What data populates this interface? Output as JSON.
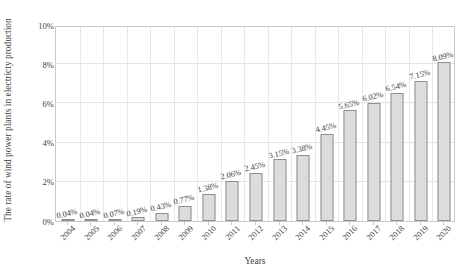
{
  "chart_data": {
    "type": "bar",
    "title": "",
    "xlabel": "Years",
    "ylabel": "The rate of wind power plants in electricty production",
    "categories": [
      "2004",
      "2005",
      "2006",
      "2007",
      "2008",
      "2009",
      "2010",
      "2011",
      "2012",
      "2013",
      "2014",
      "2015",
      "2016",
      "2017",
      "2018",
      "2019",
      "2020"
    ],
    "values": [
      0.04,
      0.04,
      0.07,
      0.19,
      0.43,
      0.77,
      1.38,
      2.06,
      2.45,
      3.15,
      3.38,
      4.45,
      5.65,
      6.02,
      6.54,
      7.15,
      8.09
    ],
    "value_labels": [
      "0.04%",
      "0.04%",
      "0.07%",
      "0.19%",
      "0.43%",
      "0.77%",
      "1.38%",
      "2.06%",
      "2.45%",
      "3.15%",
      "3.38%",
      "4.45%",
      "5.65%",
      "6.02%",
      "6.54%",
      "7.15%",
      "8.09%"
    ],
    "ylim": [
      0,
      10
    ],
    "ytick_values": [
      0,
      2,
      4,
      6,
      8,
      10
    ],
    "ytick_labels": [
      "0%",
      "2%",
      "4%",
      "6%",
      "8%",
      "10%"
    ],
    "grid": true,
    "grid_axes": "both",
    "legend": false,
    "legend_position": "none",
    "bar_fill_color": "#dcdcdc",
    "bar_border_color": "#8f8f8f",
    "grid_color": "#e3e3e3",
    "axis_color": "#c9c9c9",
    "text_color": "#3d3d3d"
  }
}
